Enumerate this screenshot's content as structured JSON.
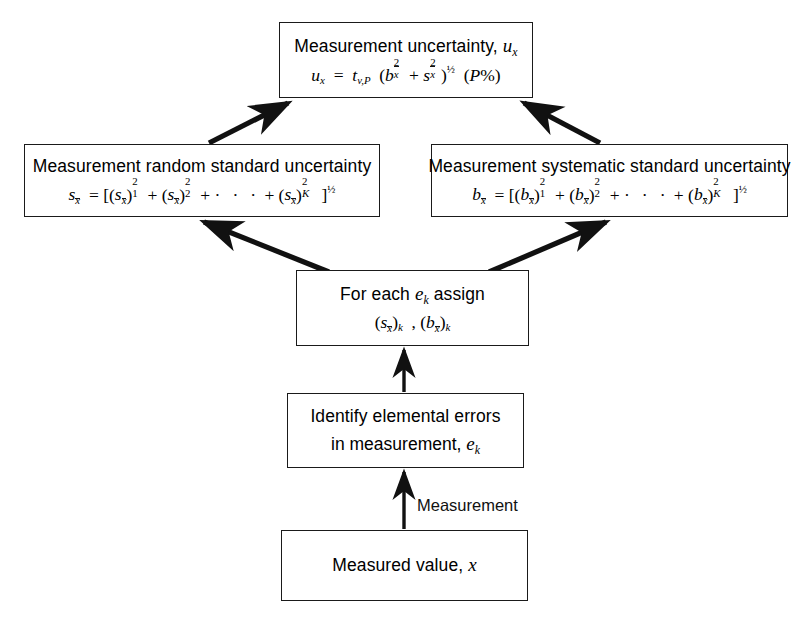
{
  "diagram": {
    "type": "flowchart",
    "background_color": "#ffffff",
    "line_color": "#1a1a1a",
    "nodes": [
      {
        "id": "measured-value",
        "line1": "Measured value, x",
        "line2": ""
      },
      {
        "id": "identify-errors",
        "line1": "Identify elemental errors",
        "line2": "in measurement, e_k"
      },
      {
        "id": "assign",
        "line1": "For each e_k assign",
        "line2": "(s_x̄)_k , (b_x̄)_k"
      },
      {
        "id": "random-standard-uncertainty",
        "line1": "Measurement random standard uncertainty",
        "line2": "s_x̄ = [(s_x̄)²₁ + (s_x̄)²₂ + · · · + (s_x̄)²_K ]^½"
      },
      {
        "id": "systematic-standard-uncertainty",
        "line1": "Measurement systematic standard uncertainty",
        "line2": "b_x̄ = [(b_x̄)²₁ + (b_x̄)²₂ + · · · + (b_x̄)²_K ]^½"
      },
      {
        "id": "measurement-uncertainty",
        "line1": "Measurement uncertainty, u_x",
        "line2": "u_x = t_v,P (b_x̄² + s_x̄²)^½ (P%)"
      }
    ],
    "edge_labels": {
      "measurement": "Measurement"
    },
    "edges": [
      {
        "from": "measured-value",
        "to": "identify-errors",
        "label": "Measurement",
        "style": "straight-up"
      },
      {
        "from": "identify-errors",
        "to": "assign",
        "label": "",
        "style": "straight-up"
      },
      {
        "from": "assign",
        "to": "random-standard-uncertainty",
        "label": "",
        "style": "diagonal-up-left"
      },
      {
        "from": "assign",
        "to": "systematic-standard-uncertainty",
        "label": "",
        "style": "diagonal-up-right"
      },
      {
        "from": "random-standard-uncertainty",
        "to": "measurement-uncertainty",
        "label": "",
        "style": "diagonal-up-right"
      },
      {
        "from": "systematic-standard-uncertainty",
        "to": "measurement-uncertainty",
        "label": "",
        "style": "diagonal-up-left"
      }
    ]
  }
}
